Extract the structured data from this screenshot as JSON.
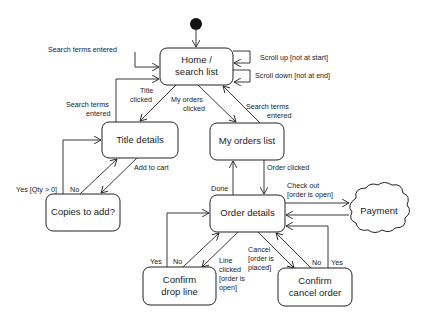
{
  "diagram": {
    "type": "UML state machine",
    "states": {
      "home": {
        "line1": "Home /",
        "line2": "search list"
      },
      "title_details": {
        "label": "Title details"
      },
      "my_orders": {
        "label": "My orders list"
      },
      "copies": {
        "label": "Copies to add?"
      },
      "order_details": {
        "label": "Order details"
      },
      "payment": {
        "label": "Payment"
      },
      "confirm_drop": {
        "line1": "Confirm",
        "line2": "drop line"
      },
      "confirm_cancel": {
        "line1": "Confirm",
        "line2": "cancel order"
      }
    },
    "transitions": {
      "search_self": "Search terms entered",
      "scroll_up": "Scroll up [not at start]",
      "scroll_down": "Scroll down [not at end]",
      "title_clicked": {
        "line1": "Title",
        "line2": "clicked"
      },
      "my_orders_clicked": {
        "line1": "My orders",
        "line2": "clicked"
      },
      "search_from_title": {
        "line1": "Search terms",
        "line2": "entered"
      },
      "search_from_orders": {
        "line1": "Search terms",
        "line2": "entered"
      },
      "add_to_cart": "Add to cart",
      "yes_qty": "Yes [Qty > 0]",
      "no_copies": "No",
      "order_clicked": "Order clicked",
      "done": "Done",
      "check_out": {
        "line1": "Check out",
        "line2": "[order is open]"
      },
      "yes_drop": "Yes",
      "no_drop": "No",
      "line_clicked": {
        "line1": "Line",
        "line2": "clicked",
        "line3": "[order is",
        "line4": "open]"
      },
      "cancel": {
        "line1": "Cancel",
        "line2": "[order is",
        "line3": "placed]"
      },
      "no_cancel": "No",
      "yes_cancel": "Yes"
    }
  }
}
